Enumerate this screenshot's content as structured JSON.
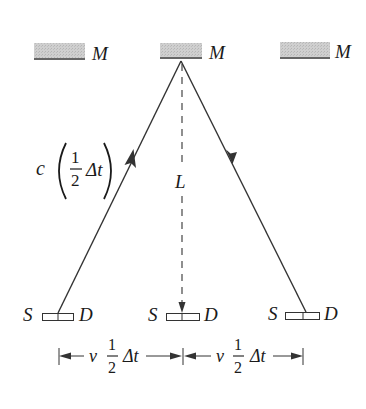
{
  "diagram": {
    "mirrors": [
      {
        "label": "M",
        "x": 34,
        "y": 43,
        "w": 51,
        "h": 16
      },
      {
        "label": "M",
        "x": 160,
        "y": 43,
        "w": 42,
        "h": 15
      },
      {
        "label": "M",
        "x": 280,
        "y": 42,
        "w": 50,
        "h": 16
      }
    ],
    "source_detector": [
      {
        "source_label": "S",
        "detector_label": "D",
        "box_x": 42,
        "box_y": 313
      },
      {
        "source_label": "S",
        "detector_label": "D",
        "box_x": 166,
        "box_y": 313
      },
      {
        "source_label": "S",
        "detector_label": "D",
        "box_x": 285,
        "box_y": 312
      }
    ],
    "labels": {
      "diagonal_speed": "c",
      "fraction_num": "1",
      "fraction_den": "2",
      "delta_t": "Δt",
      "vertical_length": "L",
      "horizontal_speed": "v"
    },
    "dimensions": [
      {
        "prefix": "v",
        "num": "1",
        "den": "2",
        "suffix": "Δt"
      },
      {
        "prefix": "v",
        "num": "1",
        "den": "2",
        "suffix": "Δt"
      }
    ],
    "colors": {
      "mirror_fill": "#c8c8c8",
      "line": "#333333",
      "text": "#1a1a1a",
      "background": "#ffffff"
    }
  }
}
